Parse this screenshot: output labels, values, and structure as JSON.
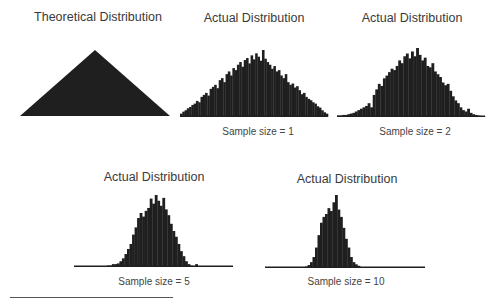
{
  "chart_data": [
    {
      "type": "area",
      "title": "Theoretical Distribution",
      "label": "",
      "shape": "triangle",
      "x_range": [
        20,
        170
      ],
      "baseline_y": 116,
      "peak_y": 50,
      "title_pos": [
        98,
        18
      ]
    },
    {
      "type": "bar",
      "title": "Actual Distribution",
      "label": "Sample size = 1",
      "x_range": [
        180,
        328
      ],
      "baseline_y": 117,
      "peak_y": 50,
      "title_pos": [
        254,
        19
      ],
      "label_pos": [
        254,
        127
      ],
      "values": [
        0.05,
        0.08,
        0.1,
        0.13,
        0.15,
        0.18,
        0.2,
        0.24,
        0.22,
        0.3,
        0.33,
        0.36,
        0.32,
        0.42,
        0.45,
        0.48,
        0.43,
        0.55,
        0.58,
        0.52,
        0.64,
        0.68,
        0.62,
        0.73,
        0.7,
        0.78,
        0.82,
        0.75,
        0.85,
        0.88,
        0.8,
        0.92,
        0.86,
        0.95,
        0.9,
        0.84,
        1.0,
        0.87,
        0.82,
        0.78,
        0.72,
        0.76,
        0.68,
        0.7,
        0.62,
        0.58,
        0.64,
        0.52,
        0.48,
        0.5,
        0.44,
        0.46,
        0.4,
        0.34,
        0.36,
        0.3,
        0.27,
        0.25,
        0.22,
        0.2,
        0.16,
        0.14,
        0.1,
        0.07,
        0.05
      ]
    },
    {
      "type": "bar",
      "title": "Actual Distribution",
      "label": "Sample size = 2",
      "x_range": [
        337,
        485
      ],
      "baseline_y": 117,
      "peak_y": 48,
      "title_pos": [
        412,
        19
      ],
      "label_pos": [
        412,
        127
      ],
      "values": [
        0.02,
        0.02,
        0.03,
        0.03,
        0.04,
        0.05,
        0.06,
        0.08,
        0.1,
        0.12,
        0.14,
        0.16,
        0.2,
        0.14,
        0.32,
        0.4,
        0.48,
        0.45,
        0.56,
        0.6,
        0.65,
        0.7,
        0.68,
        0.74,
        0.82,
        0.78,
        0.88,
        0.92,
        0.85,
        0.95,
        0.88,
        1.0,
        0.9,
        0.82,
        0.86,
        0.74,
        0.72,
        0.78,
        0.66,
        0.62,
        0.58,
        0.5,
        0.46,
        0.48,
        0.38,
        0.3,
        0.24,
        0.2,
        0.14,
        0.1,
        0.08,
        0.12,
        0.06,
        0.04,
        0.03,
        0.02,
        0.01,
        0.01
      ]
    },
    {
      "type": "bar",
      "title": "Actual Distribution",
      "label": "Sample size = 5",
      "x_range": [
        74,
        233
      ],
      "baseline_y": 267,
      "peak_y": 195,
      "title_pos": [
        154,
        178
      ],
      "label_pos": [
        154,
        277
      ],
      "values": [
        0,
        0,
        0,
        0,
        0,
        0,
        0,
        0,
        0,
        0,
        0,
        0,
        0,
        0.02,
        0.02,
        0.04,
        0.04,
        0.05,
        0.08,
        0.12,
        0.18,
        0.25,
        0.32,
        0.45,
        0.55,
        0.68,
        0.75,
        0.7,
        0.78,
        0.82,
        0.95,
        0.88,
        1.0,
        0.92,
        0.85,
        0.96,
        0.8,
        0.72,
        0.6,
        0.5,
        0.42,
        0.32,
        0.22,
        0.15,
        0.08,
        0.04,
        0.02,
        0.01,
        0.04,
        0.01,
        0,
        0,
        0,
        0,
        0,
        0,
        0,
        0,
        0,
        0,
        0,
        0,
        0
      ]
    },
    {
      "type": "bar",
      "title": "Actual Distribution",
      "label": "Sample size = 10",
      "x_range": [
        265,
        425
      ],
      "baseline_y": 268,
      "peak_y": 195,
      "title_pos": [
        327,
        178
      ],
      "label_pos": [
        327,
        282
      ],
      "values": [
        0,
        0,
        0,
        0,
        0,
        0,
        0,
        0,
        0,
        0,
        0,
        0,
        0,
        0,
        0,
        0,
        0.02,
        0.04,
        0.08,
        0.15,
        0.28,
        0.45,
        0.62,
        0.7,
        0.74,
        0.82,
        0.78,
        0.9,
        1.0,
        0.8,
        0.7,
        0.55,
        0.4,
        0.28,
        0.15,
        0.08,
        0.05,
        0.03,
        0.01,
        0,
        0,
        0,
        0,
        0,
        0,
        0,
        0,
        0,
        0,
        0,
        0,
        0,
        0,
        0,
        0,
        0,
        0,
        0,
        0,
        0,
        0,
        0,
        0,
        0
      ]
    }
  ],
  "colors": {
    "fill": "#1f1f1f",
    "text": "#3a3a3a"
  }
}
